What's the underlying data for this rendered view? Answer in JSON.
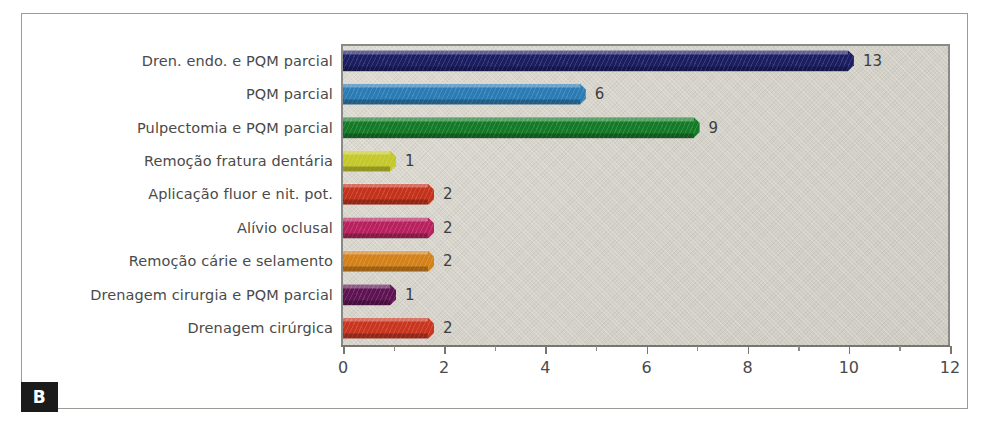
{
  "panel": {
    "letter": "B"
  },
  "chart_data": {
    "type": "bar",
    "orientation": "horizontal",
    "title": "",
    "xlabel": "",
    "ylabel": "",
    "xlim": [
      0,
      12
    ],
    "xticks": [
      0,
      2,
      4,
      6,
      8,
      10,
      12
    ],
    "xtick_labels": [
      "0",
      "2",
      "4",
      "6",
      "8",
      "10",
      "12"
    ],
    "minor_tick_step": 1,
    "grid": false,
    "legend": "none",
    "categories": [
      "Dren. endo. e PQM parcial",
      "PQM parcial",
      "Pulpectomia e PQM parcial",
      "Remoção fratura dentária",
      "Aplicação fluor e nit. pot.",
      "Alívio oclusal",
      "Remoção cárie e selamento",
      "Drenagem cirurgia e PQM parcial",
      "Drenagem cirúrgica"
    ],
    "values": [
      13,
      6,
      9,
      1,
      2,
      2,
      2,
      1,
      2
    ],
    "data_labels": [
      "13",
      "6",
      "9",
      "1",
      "2",
      "2",
      "2",
      "1",
      "2"
    ],
    "bar_lengths_axis_units": [
      10.1,
      4.8,
      7.05,
      1.05,
      1.8,
      1.8,
      1.8,
      1.05,
      1.8
    ],
    "colors": [
      "#1b1e63",
      "#2b7cb5",
      "#157a28",
      "#c4c82a",
      "#c5321b",
      "#b8215e",
      "#d4811a",
      "#5e1352",
      "#ca3520"
    ],
    "plot_background": "#d6d3cb",
    "axis_color": "#77776f",
    "text_color": "#4a4a4a"
  }
}
